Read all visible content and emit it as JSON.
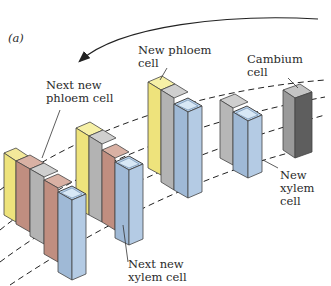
{
  "figure": {
    "panel_label": "(a)",
    "labels": {
      "new_phloem_cell": "New phloem\ncell",
      "cambium_cell": "Cambium\ncell",
      "next_new_phloem_cell": "Next new\nphloem cell",
      "new_xylem_cell": "New\nxylem\ncell",
      "next_new_xylem_cell": "Next new\nxylem cell"
    },
    "colors": {
      "phloem_yellow": "#f2ec9a",
      "phloem_red": "#c99a8c",
      "cambium_gray": "#a8a8a8",
      "cambium_dark": "#6a6a6a",
      "xylem_blue": "#a9c3e0",
      "line": "#222222"
    }
  }
}
